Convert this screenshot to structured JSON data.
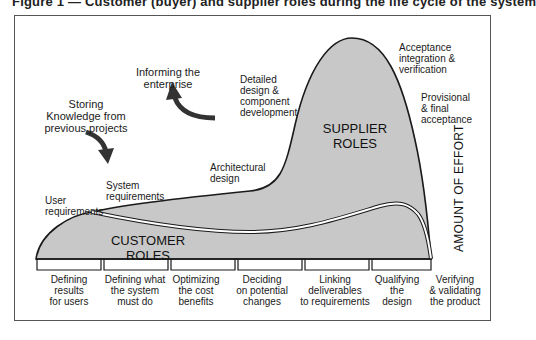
{
  "caption": "Figure 1 — Customer (buyer) and supplier roles during the life cycle of the system",
  "diagram": {
    "axis_label": "AMOUNT OF EFFORT",
    "regions": {
      "customer": "CUSTOMER ROLES",
      "supplier_line1": "SUPPLIER",
      "supplier_line2": "ROLES"
    },
    "annotations": {
      "storing": [
        "Storing",
        "Knowledge from",
        "previous projects"
      ],
      "informing": [
        "Informing the",
        "enterprise"
      ],
      "user_req": [
        "User",
        "requirements"
      ],
      "system_req": [
        "System",
        "requirements"
      ],
      "architectural": [
        "Architectural",
        "design"
      ],
      "detailed": [
        "Detailed",
        "design &",
        "component",
        "development"
      ],
      "acceptance": [
        "Acceptance",
        "integration &",
        "verification"
      ],
      "provisional": [
        "Provisional",
        "& final",
        "acceptance"
      ]
    },
    "phases": [
      {
        "l1": "Defining",
        "l2": "results",
        "l3": "for users"
      },
      {
        "l1": "Defining what",
        "l2": "the system",
        "l3": "must do"
      },
      {
        "l1": "Optimizing",
        "l2": "the cost",
        "l3": "benefits"
      },
      {
        "l1": "Deciding",
        "l2": "on potential",
        "l3": "changes"
      },
      {
        "l1": "Linking",
        "l2": "deliverables",
        "l3": "to requirements"
      },
      {
        "l1": "Qualifying",
        "l2": "the",
        "l3": "design"
      },
      {
        "l1": "Verifying",
        "l2": "& validating",
        "l3": "the product"
      }
    ],
    "colors": {
      "fill": "#c8c8c8",
      "stroke": "#1a1a1a",
      "arrow": "#333333"
    }
  }
}
